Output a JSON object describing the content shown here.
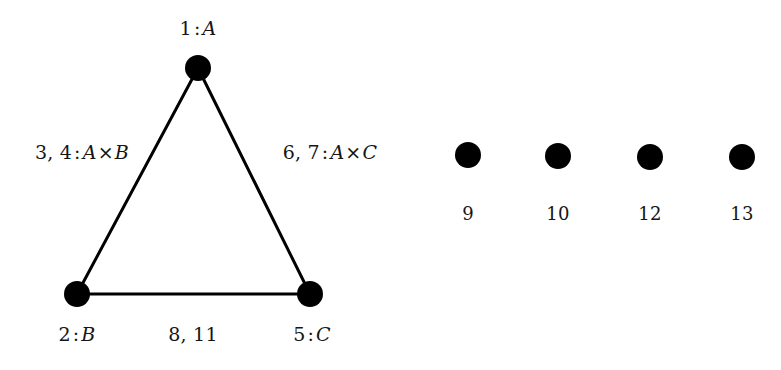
{
  "figure": {
    "background_color": "#ffffff",
    "node_color": "#000000",
    "edge_color": "#000000",
    "node_radius": 13,
    "iso_node_radius": 13,
    "edge_width": 3
  },
  "triangle": {
    "nodes": [
      {
        "id": "A",
        "label_number": "1",
        "label_name": "A",
        "cx": 198,
        "cy": 68,
        "label_x": 198,
        "label_y": 28
      },
      {
        "id": "B",
        "label_number": "2",
        "label_name": "B",
        "cx": 77,
        "cy": 294,
        "label_x": 77,
        "label_y": 334
      },
      {
        "id": "C",
        "label_number": "5",
        "label_name": "C",
        "cx": 310,
        "cy": 294,
        "label_x": 312,
        "label_y": 334
      }
    ],
    "node_labels": {
      "apex": {
        "numbers": "1",
        "separator": ":",
        "name": "A"
      },
      "bottom_left": {
        "numbers": "2",
        "separator": ":",
        "name": "B"
      },
      "bottom_right": {
        "numbers": "5",
        "separator": ":",
        "name": "C"
      }
    },
    "edges": [
      {
        "id": "A-B",
        "from": "A",
        "to": "B",
        "numbers": "3, 4",
        "separator": ":",
        "name_left": "A",
        "operator": "×",
        "name_right": "B",
        "label_x": 82,
        "label_y": 152
      },
      {
        "id": "A-C",
        "from": "A",
        "to": "C",
        "numbers": "6, 7",
        "separator": ":",
        "name_left": "A",
        "operator": "×",
        "name_right": "C",
        "label_x": 330,
        "label_y": 152
      },
      {
        "id": "B-C",
        "from": "B",
        "to": "C",
        "numbers": "8, 11",
        "separator": "",
        "name_left": "",
        "operator": "",
        "name_right": "",
        "label_x": 193,
        "label_y": 334
      }
    ]
  },
  "isolated_nodes": [
    {
      "label": "9",
      "cx": 468,
      "cy": 155,
      "label_x": 468,
      "label_y": 214
    },
    {
      "label": "10",
      "cx": 558,
      "cy": 156,
      "label_x": 558,
      "label_y": 214
    },
    {
      "label": "12",
      "cx": 650,
      "cy": 157,
      "label_x": 650,
      "label_y": 214
    },
    {
      "label": "13",
      "cx": 742,
      "cy": 157,
      "label_x": 742,
      "label_y": 214
    }
  ]
}
